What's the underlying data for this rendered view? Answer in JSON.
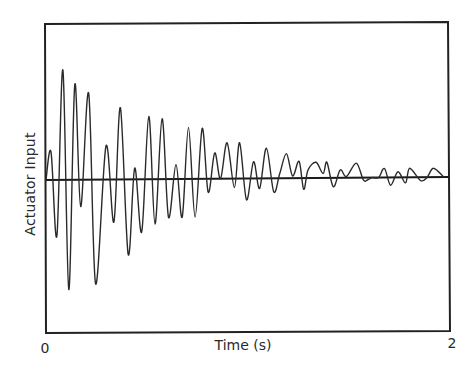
{
  "chart_data": {
    "type": "line",
    "title": "",
    "xlabel": "Time (s)",
    "ylabel": "Actuator Input",
    "x_ticks": [
      "0",
      "2"
    ],
    "xlim": [
      0,
      2
    ],
    "ylim": [
      -1,
      1
    ],
    "grid": false,
    "legend": null,
    "annotations": [],
    "series": [
      {
        "name": "Actuator Input",
        "x": [
          0.0,
          0.025,
          0.054,
          0.084,
          0.113,
          0.143,
          0.172,
          0.212,
          0.246,
          0.298,
          0.337,
          0.369,
          0.408,
          0.44,
          0.475,
          0.51,
          0.541,
          0.576,
          0.608,
          0.645,
          0.676,
          0.707,
          0.74,
          0.775,
          0.805,
          0.837,
          0.866,
          0.899,
          0.935,
          0.961,
          0.995,
          1.03,
          1.06,
          1.094,
          1.13,
          1.16,
          1.193,
          1.224,
          1.256,
          1.279,
          1.3,
          1.34,
          1.375,
          1.394,
          1.426,
          1.46,
          1.491,
          1.54,
          1.575,
          1.597,
          1.619,
          1.651,
          1.68,
          1.71,
          1.747,
          1.784,
          1.805,
          1.859,
          1.892,
          1.923,
          1.974
        ],
        "y": [
          0.0,
          0.25,
          -0.5,
          0.98,
          -0.98,
          0.85,
          -0.24,
          0.77,
          -0.93,
          0.3,
          -0.38,
          0.64,
          -0.67,
          0.1,
          -0.47,
          0.56,
          -0.4,
          0.54,
          -0.34,
          0.13,
          -0.34,
          0.46,
          -0.34,
          0.45,
          -0.12,
          0.23,
          0.0,
          0.32,
          -0.08,
          0.32,
          -0.19,
          0.15,
          -0.09,
          0.27,
          -0.12,
          0.04,
          0.22,
          0.02,
          0.15,
          -0.1,
          0.07,
          0.14,
          0.04,
          0.14,
          -0.08,
          0.07,
          0.01,
          0.13,
          -0.02,
          -0.02,
          0.0,
          0.0,
          0.08,
          -0.07,
          0.05,
          -0.05,
          0.08,
          -0.03,
          0.0,
          0.08,
          0.0
        ]
      }
    ]
  },
  "labels": {
    "ylabel": "Actuator Input",
    "xlabel": "Time (s)",
    "x_tick_start": "0",
    "x_tick_end": "2"
  },
  "colors": {
    "line": "#2a2a2a",
    "frame": "#222222",
    "background": "#ffffff"
  }
}
